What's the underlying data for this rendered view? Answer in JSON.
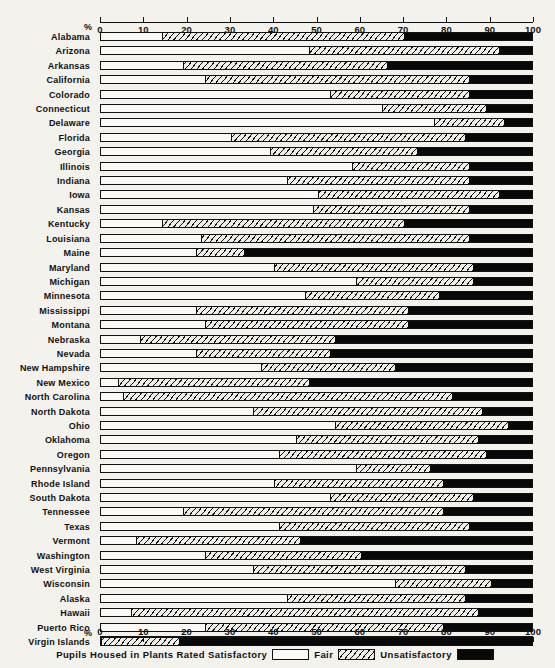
{
  "chart_data": {
    "type": "bar",
    "subtype": "stacked-horizontal-100pct",
    "title": "",
    "xlabel": "%",
    "ylabel": "",
    "xlim": [
      0,
      100
    ],
    "grid": false,
    "legend_position": "bottom",
    "legend_caption": "Pupils Housed in Plants Rated",
    "axis_unit_symbol": "%",
    "tick_values": [
      0,
      10,
      20,
      30,
      40,
      50,
      60,
      70,
      80,
      90,
      100
    ],
    "tick_labels": [
      "0",
      "10",
      "20",
      "30",
      "40",
      "50",
      "60",
      "70",
      "80",
      "90",
      "100"
    ],
    "series": [
      {
        "name": "Satisfactory",
        "key": "satisfactory",
        "color": "#fbfaf7",
        "pattern": "solid-white"
      },
      {
        "name": "Fair",
        "key": "fair",
        "color": "#efeee9",
        "pattern": "diagonal-hatch"
      },
      {
        "name": "Unsatisfactory",
        "key": "unsatisfactory",
        "color": "#080808",
        "pattern": "solid-black"
      }
    ],
    "categories": [
      "Alabama",
      "Arizona",
      "Arkansas",
      "California",
      "Colorado",
      "Connecticut",
      "Delaware",
      "Florida",
      "Georgia",
      "Illinois",
      "Indiana",
      "Iowa",
      "Kansas",
      "Kentucky",
      "Louisiana",
      "Maine",
      "Maryland",
      "Michigan",
      "Minnesota",
      "Mississippi",
      "Montana",
      "Nebraska",
      "Nevada",
      "New Hampshire",
      "New Mexico",
      "North Carolina",
      "North Dakota",
      "Ohio",
      "Oklahoma",
      "Oregon",
      "Pennsylvania",
      "Rhode Island",
      "South Dakota",
      "Tennessee",
      "Texas",
      "Vermont",
      "Washington",
      "West Virginia",
      "Wisconsin",
      "Alaska",
      "Hawaii",
      "Puerto Rico",
      "Virgin Islands"
    ],
    "rows": [
      {
        "state": "Alabama",
        "satisfactory": 14,
        "fair": 56,
        "unsatisfactory": 30,
        "b1": 14,
        "b2": 70
      },
      {
        "state": "Arizona",
        "satisfactory": 48,
        "fair": 44,
        "unsatisfactory": 8,
        "b1": 48,
        "b2": 92
      },
      {
        "state": "Arkansas",
        "satisfactory": 19,
        "fair": 47,
        "unsatisfactory": 34,
        "b1": 19,
        "b2": 66
      },
      {
        "state": "California",
        "satisfactory": 24,
        "fair": 61,
        "unsatisfactory": 15,
        "b1": 24,
        "b2": 85
      },
      {
        "state": "Colorado",
        "satisfactory": 53,
        "fair": 32,
        "unsatisfactory": 15,
        "b1": 53,
        "b2": 85
      },
      {
        "state": "Connecticut",
        "satisfactory": 65,
        "fair": 24,
        "unsatisfactory": 11,
        "b1": 65,
        "b2": 89
      },
      {
        "state": "Delaware",
        "satisfactory": 77,
        "fair": 16,
        "unsatisfactory": 7,
        "b1": 77,
        "b2": 93
      },
      {
        "state": "Florida",
        "satisfactory": 30,
        "fair": 54,
        "unsatisfactory": 16,
        "b1": 30,
        "b2": 84
      },
      {
        "state": "Georgia",
        "satisfactory": 39,
        "fair": 34,
        "unsatisfactory": 27,
        "b1": 39,
        "b2": 73
      },
      {
        "state": "Illinois",
        "satisfactory": 58,
        "fair": 27,
        "unsatisfactory": 15,
        "b1": 58,
        "b2": 85
      },
      {
        "state": "Indiana",
        "satisfactory": 43,
        "fair": 42,
        "unsatisfactory": 15,
        "b1": 43,
        "b2": 85
      },
      {
        "state": "Iowa",
        "satisfactory": 50,
        "fair": 42,
        "unsatisfactory": 8,
        "b1": 50,
        "b2": 92
      },
      {
        "state": "Kansas",
        "satisfactory": 49,
        "fair": 36,
        "unsatisfactory": 15,
        "b1": 49,
        "b2": 85
      },
      {
        "state": "Kentucky",
        "satisfactory": 14,
        "fair": 56,
        "unsatisfactory": 30,
        "b1": 14,
        "b2": 70
      },
      {
        "state": "Louisiana",
        "satisfactory": 23,
        "fair": 62,
        "unsatisfactory": 15,
        "b1": 23,
        "b2": 85
      },
      {
        "state": "Maine",
        "satisfactory": 22,
        "fair": 11,
        "unsatisfactory": 67,
        "b1": 22,
        "b2": 33
      },
      {
        "state": "Maryland",
        "satisfactory": 40,
        "fair": 46,
        "unsatisfactory": 14,
        "b1": 40,
        "b2": 86
      },
      {
        "state": "Michigan",
        "satisfactory": 59,
        "fair": 27,
        "unsatisfactory": 14,
        "b1": 59,
        "b2": 86
      },
      {
        "state": "Minnesota",
        "satisfactory": 47,
        "fair": 31,
        "unsatisfactory": 22,
        "b1": 47,
        "b2": 78
      },
      {
        "state": "Mississippi",
        "satisfactory": 22,
        "fair": 49,
        "unsatisfactory": 29,
        "b1": 22,
        "b2": 71
      },
      {
        "state": "Montana",
        "satisfactory": 24,
        "fair": 47,
        "unsatisfactory": 29,
        "b1": 24,
        "b2": 71
      },
      {
        "state": "Nebraska",
        "satisfactory": 9,
        "fair": 45,
        "unsatisfactory": 46,
        "b1": 9,
        "b2": 54
      },
      {
        "state": "Nevada",
        "satisfactory": 22,
        "fair": 31,
        "unsatisfactory": 47,
        "b1": 22,
        "b2": 53
      },
      {
        "state": "New Hampshire",
        "satisfactory": 37,
        "fair": 31,
        "unsatisfactory": 32,
        "b1": 37,
        "b2": 68
      },
      {
        "state": "New Mexico",
        "satisfactory": 4,
        "fair": 44,
        "unsatisfactory": 52,
        "b1": 4,
        "b2": 48
      },
      {
        "state": "North Carolina",
        "satisfactory": 5,
        "fair": 76,
        "unsatisfactory": 19,
        "b1": 5,
        "b2": 81
      },
      {
        "state": "North Dakota",
        "satisfactory": 35,
        "fair": 53,
        "unsatisfactory": 12,
        "b1": 35,
        "b2": 88
      },
      {
        "state": "Ohio",
        "satisfactory": 54,
        "fair": 40,
        "unsatisfactory": 6,
        "b1": 54,
        "b2": 94
      },
      {
        "state": "Oklahoma",
        "satisfactory": 45,
        "fair": 42,
        "unsatisfactory": 13,
        "b1": 45,
        "b2": 87
      },
      {
        "state": "Oregon",
        "satisfactory": 41,
        "fair": 48,
        "unsatisfactory": 11,
        "b1": 41,
        "b2": 89
      },
      {
        "state": "Pennsylvania",
        "satisfactory": 59,
        "fair": 17,
        "unsatisfactory": 24,
        "b1": 59,
        "b2": 76
      },
      {
        "state": "Rhode Island",
        "satisfactory": 40,
        "fair": 39,
        "unsatisfactory": 21,
        "b1": 40,
        "b2": 79
      },
      {
        "state": "South Dakota",
        "satisfactory": 53,
        "fair": 33,
        "unsatisfactory": 14,
        "b1": 53,
        "b2": 86
      },
      {
        "state": "Tennessee",
        "satisfactory": 19,
        "fair": 60,
        "unsatisfactory": 21,
        "b1": 19,
        "b2": 79
      },
      {
        "state": "Texas",
        "satisfactory": 41,
        "fair": 44,
        "unsatisfactory": 15,
        "b1": 41,
        "b2": 85
      },
      {
        "state": "Vermont",
        "satisfactory": 8,
        "fair": 38,
        "unsatisfactory": 54,
        "b1": 8,
        "b2": 46
      },
      {
        "state": "Washington",
        "satisfactory": 24,
        "fair": 36,
        "unsatisfactory": 40,
        "b1": 24,
        "b2": 60
      },
      {
        "state": "West Virginia",
        "satisfactory": 35,
        "fair": 49,
        "unsatisfactory": 16,
        "b1": 35,
        "b2": 84
      },
      {
        "state": "Wisconsin",
        "satisfactory": 68,
        "fair": 22,
        "unsatisfactory": 10,
        "b1": 68,
        "b2": 90
      },
      {
        "state": "Alaska",
        "satisfactory": 43,
        "fair": 41,
        "unsatisfactory": 16,
        "b1": 43,
        "b2": 84
      },
      {
        "state": "Hawaii",
        "satisfactory": 7,
        "fair": 80,
        "unsatisfactory": 13,
        "b1": 7,
        "b2": 87
      },
      {
        "state": "Puerto Rico",
        "satisfactory": 24,
        "fair": 55,
        "unsatisfactory": 21,
        "b1": 24,
        "b2": 79
      },
      {
        "state": "Virgin Islands",
        "satisfactory": 0,
        "fair": 18,
        "unsatisfactory": 82,
        "b1": 0,
        "b2": 18
      }
    ]
  },
  "legend": {
    "caption_prefix": "Pupils  Housed  in  Plants  Rated  Satisfactory",
    "fair_label": "Fair",
    "unsatisfactory_label": "Unsatisfactory"
  },
  "axis": {
    "percent_symbol": "%"
  },
  "colors": {
    "satisfactory": "#fbfaf7",
    "fair": "#efeee9",
    "unsatisfactory": "#080808",
    "ink": "#111111",
    "paper": "#f4f2ed"
  }
}
